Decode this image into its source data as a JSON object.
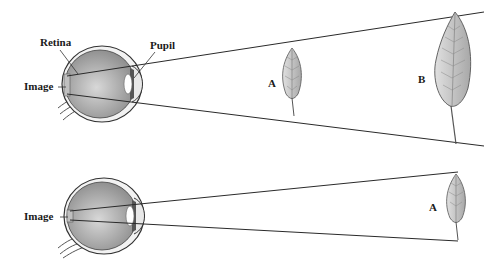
{
  "diagram": {
    "top_panel": {
      "labels": {
        "retina": "Retina",
        "pupil": "Pupil",
        "image": "Image",
        "object_a": "A",
        "object_b": "B"
      }
    },
    "bottom_panel": {
      "labels": {
        "image": "Image",
        "object_a": "A"
      }
    },
    "colors": {
      "line": "#2a2a2a",
      "eye_fill": "#9a9a9a",
      "leaf_fill": "#c8c8c8",
      "background": "#ffffff"
    }
  }
}
